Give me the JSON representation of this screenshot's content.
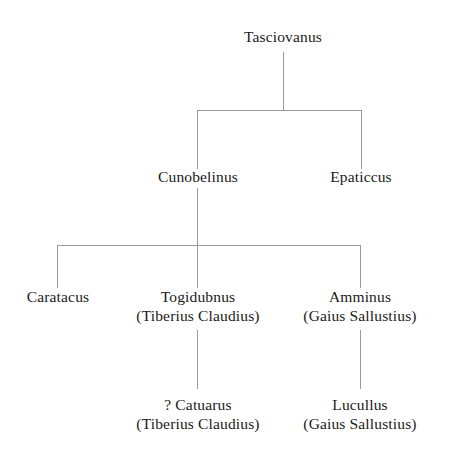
{
  "diagram": {
    "type": "family-tree",
    "line_color": "#9a9a9a",
    "text_color": "#1a1a1a",
    "background_color": "#ffffff"
  },
  "nodes": {
    "tasciovanus": {
      "name": "Tasciovanus",
      "alt": "",
      "generation": 1,
      "x": 283,
      "y": 40
    },
    "cunobelinus": {
      "name": "Cunobelinus",
      "alt": "",
      "generation": 2,
      "x": 198,
      "y": 180
    },
    "epaticcus": {
      "name": "Epaticcus",
      "alt": "",
      "generation": 2,
      "x": 361,
      "y": 180
    },
    "caratacus": {
      "name": "Caratacus",
      "alt": "",
      "generation": 3,
      "x": 58,
      "y": 299
    },
    "togidubnus": {
      "name": "Togidubnus",
      "alt": "(Tiberius Claudius)",
      "generation": 3,
      "x": 198,
      "y": 299
    },
    "amminus": {
      "name": "Amminus",
      "alt": "(Gaius Sallustius)",
      "generation": 3,
      "x": 360,
      "y": 299
    },
    "catuarus": {
      "name": "? Catuarus",
      "alt": "(Tiberius Claudius)",
      "generation": 4,
      "x": 198,
      "y": 407
    },
    "lucullus": {
      "name": "Lucullus",
      "alt": "(Gaius Sallustius)",
      "generation": 4,
      "x": 360,
      "y": 407
    }
  },
  "connectors": [
    {
      "id": "trunk-gen1",
      "from": "tasciovanus",
      "kind": "vertical",
      "x": 283,
      "y1": 52,
      "y2": 110
    },
    {
      "id": "bar-gen2",
      "kind": "horizontal",
      "y": 110,
      "x1": 197,
      "x2": 361
    },
    {
      "id": "drop-cunobelinus",
      "to": "cunobelinus",
      "kind": "vertical",
      "x": 197,
      "y1": 110,
      "y2": 169
    },
    {
      "id": "drop-epaticcus",
      "to": "epaticcus",
      "kind": "vertical",
      "x": 361,
      "y1": 110,
      "y2": 169
    },
    {
      "id": "trunk-cunobelinus",
      "from": "cunobelinus",
      "kind": "vertical",
      "x": 197,
      "y1": 188,
      "y2": 245
    },
    {
      "id": "bar-gen3",
      "kind": "horizontal",
      "y": 245,
      "x1": 57,
      "x2": 360
    },
    {
      "id": "drop-caratacus",
      "to": "caratacus",
      "kind": "vertical",
      "x": 57,
      "y1": 245,
      "y2": 288
    },
    {
      "id": "drop-togidubnus",
      "to": "togidubnus",
      "kind": "vertical",
      "x": 197,
      "y1": 245,
      "y2": 288
    },
    {
      "id": "drop-amminus",
      "to": "amminus",
      "kind": "vertical",
      "x": 360,
      "y1": 245,
      "y2": 288
    },
    {
      "id": "trunk-togidubnus",
      "from": "togidubnus",
      "kind": "vertical",
      "x": 197,
      "y1": 330,
      "y2": 389
    },
    {
      "id": "trunk-amminus",
      "from": "amminus",
      "kind": "vertical",
      "x": 360,
      "y1": 330,
      "y2": 389
    }
  ]
}
